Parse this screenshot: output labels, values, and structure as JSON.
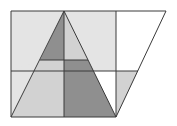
{
  "diagram": {
    "title": "",
    "colors": {
      "background": "#ffffff",
      "stroke": "#3a3a3a",
      "light_fill": "#e4e4e4",
      "mid_fill": "#d2d2d2",
      "dark_fill": "#8f8f8f",
      "white_fill": "#ffffff"
    },
    "points": {
      "top_left": [
        11,
        11
      ],
      "apex": [
        64,
        11
      ],
      "top_mid_right": [
        116,
        11
      ],
      "top_right": [
        166,
        11
      ],
      "inner_left": [
        40,
        60
      ],
      "inner_mid": [
        64,
        60
      ],
      "inner_right": [
        88,
        60
      ],
      "mid_left": [
        11,
        71
      ],
      "mid_right_vertical": [
        116,
        71
      ],
      "mid_right_edge": [
        138,
        71
      ],
      "bottom_left": [
        11,
        117
      ],
      "bottom_mid": [
        64,
        117
      ],
      "bottom_right": [
        116,
        117
      ]
    },
    "labels": []
  }
}
